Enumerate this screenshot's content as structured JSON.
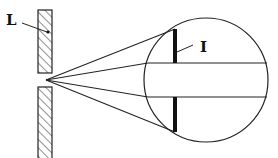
{
  "diagram": {
    "type": "optics-aperture-magnified-view",
    "labels": {
      "L": "L",
      "I": "I"
    },
    "colors": {
      "stroke": "#222222",
      "background": "#ffffff"
    },
    "elements": {
      "wall_upper": {
        "x": 38,
        "y": 10,
        "w": 14,
        "h": 63
      },
      "wall_lower": {
        "x": 38,
        "y": 87,
        "w": 14,
        "h": 71
      },
      "focal_point": {
        "x": 46,
        "y": 80
      },
      "circle": {
        "cx": 206,
        "cy": 80,
        "r": 62
      },
      "bar_x": 175,
      "bar_upper": [
        29,
        63
      ],
      "bar_lower": [
        97,
        132
      ],
      "band_y": [
        63,
        97
      ]
    }
  }
}
